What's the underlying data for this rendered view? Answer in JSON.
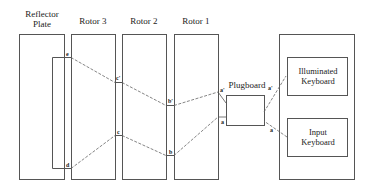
{
  "diagram": {
    "components": {
      "reflector": {
        "label_line1": "Reflector",
        "label_line2": "Plate"
      },
      "rotor3": {
        "label": "Rotor 3"
      },
      "rotor2": {
        "label": "Rotor 2"
      },
      "rotor1": {
        "label": "Rotor 1"
      },
      "plugboard": {
        "label": "Plugboard"
      },
      "illuminated_keyboard": {
        "label_line1": "Illuminated",
        "label_line2": "Keyboard"
      },
      "input_keyboard": {
        "label_line1": "Input",
        "label_line2": "Keyboard"
      }
    },
    "points": {
      "e": "e",
      "d": "d",
      "c_prime": "c'",
      "c": "c",
      "b_prime": "b'",
      "b": "b",
      "a_prime_left": "a'",
      "a_left": "a",
      "a_prime_right": "a'",
      "a_right": "a"
    },
    "colors": {
      "stroke": "#555555",
      "text": "#222222",
      "background": "#ffffff"
    }
  }
}
